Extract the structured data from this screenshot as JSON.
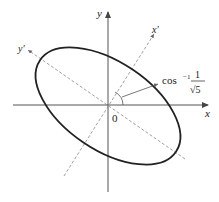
{
  "diagram": {
    "type": "rotated-ellipse-coordinate-axes",
    "axes": {
      "x_label": "x",
      "y_label": "y",
      "x_prime_label": "x′",
      "y_prime_label": "y′",
      "origin_label": "0"
    },
    "angle_annotation": {
      "prefix": "cos",
      "superscript": "−1",
      "numerator": "1",
      "denominator": "√5"
    },
    "colors": {
      "axes": "#555555",
      "rotated_axes": "#888888",
      "ellipse": "#222222",
      "text": "#222222"
    }
  }
}
